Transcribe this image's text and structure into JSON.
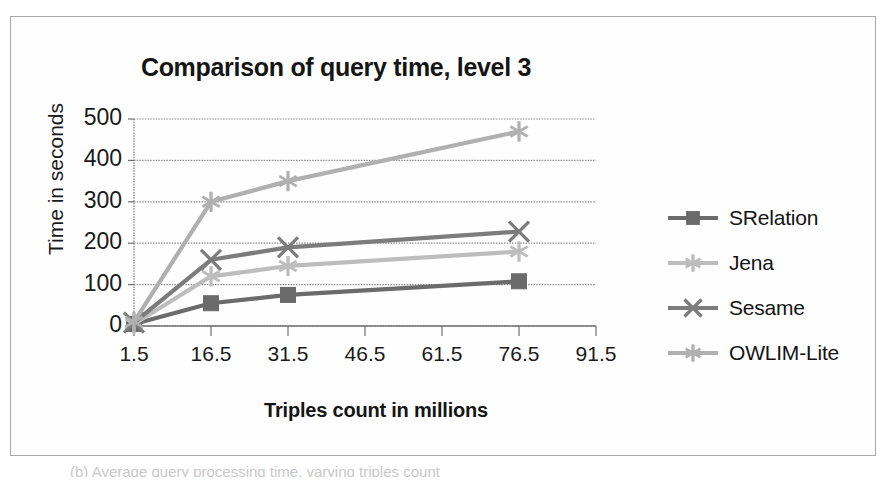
{
  "figure": {
    "caption_partial": "(b) Average query processing time, varying triples count"
  },
  "chart_data": {
    "type": "line",
    "title": "Comparison of query time, level 3",
    "xlabel": "Triples count in millions",
    "ylabel": "Time in seconds",
    "x": [
      1.5,
      16.5,
      31.5,
      76.5
    ],
    "xticks": [
      "1.5",
      "16.5",
      "31.5",
      "46.5",
      "61.5",
      "76.5",
      "91.5"
    ],
    "xtick_values": [
      1.5,
      16.5,
      31.5,
      46.5,
      61.5,
      76.5,
      91.5
    ],
    "yticks": [
      "0",
      "100",
      "200",
      "300",
      "400",
      "500"
    ],
    "ytick_values": [
      0,
      100,
      200,
      300,
      400,
      500
    ],
    "xlim": [
      1.5,
      91.5
    ],
    "ylim": [
      0,
      500
    ],
    "grid": true,
    "legend_position": "right",
    "series": [
      {
        "name": "SRelation",
        "values": [
          5,
          55,
          75,
          108
        ],
        "color": "#6b6b6b",
        "marker": "square"
      },
      {
        "name": "Jena",
        "values": [
          5,
          120,
          145,
          180
        ],
        "color": "#bdbdbd",
        "marker": "star"
      },
      {
        "name": "Sesame",
        "values": [
          8,
          160,
          190,
          228
        ],
        "color": "#7c7c7c",
        "marker": "x"
      },
      {
        "name": "OWLIM-Lite",
        "values": [
          10,
          300,
          350,
          470
        ],
        "color": "#b0b0b0",
        "marker": "asterisk"
      }
    ]
  }
}
